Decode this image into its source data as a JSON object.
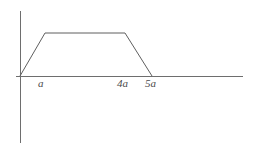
{
  "figure": {
    "kind": "piecewise-linear-trapezoid-graph",
    "background_color": "#ffffff",
    "line_color": "#5f5f5f",
    "axis_color": "#6e6e6e",
    "label_color": "#4a4a4a"
  },
  "axes": {
    "x_axis": {
      "name": "horizontal-axis",
      "y": 76,
      "x_start": 16,
      "x_end": 243,
      "label": ""
    },
    "y_axis": {
      "name": "vertical-axis",
      "x": 20,
      "y_start": 11,
      "y_end": 143,
      "label": ""
    },
    "origin": {
      "x": 20,
      "y": 76
    }
  },
  "tick_labels": [
    {
      "text": "a",
      "x": 38,
      "y": 78
    },
    {
      "text": "4a",
      "x": 117,
      "y": 78
    },
    {
      "text": "5a",
      "x": 145,
      "y": 78
    }
  ],
  "chart_data": {
    "type": "line",
    "title": "",
    "xlabel": "",
    "ylabel": "",
    "grid": false,
    "legend": null,
    "xlim": [
      0,
      7
    ],
    "ylim": [
      0,
      1.3
    ],
    "x_tick_labels": [
      "a",
      "4a",
      "5a"
    ],
    "x_tick_values": [
      1,
      4,
      5
    ],
    "y_tick_labels": [],
    "series": [
      {
        "name": "trapezoid-profile",
        "x": [
          0,
          1,
          4,
          5
        ],
        "y": [
          0,
          1,
          1,
          0
        ],
        "pixel_points": [
          {
            "x": 20,
            "y": 76
          },
          {
            "x": 45,
            "y": 33
          },
          {
            "x": 125,
            "y": 33
          },
          {
            "x": 152,
            "y": 76
          }
        ],
        "segments": [
          {
            "name": "rising-ramp",
            "from": "0",
            "to": "a",
            "description": "linear increase from origin to plateau"
          },
          {
            "name": "flat-plateau",
            "from": "a",
            "to": "4a",
            "description": "constant maximum value"
          },
          {
            "name": "falling-ramp",
            "from": "4a",
            "to": "5a",
            "description": "linear decrease back to zero"
          }
        ]
      }
    ]
  }
}
